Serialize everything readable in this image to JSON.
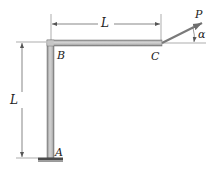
{
  "figure": {
    "type": "structural frame",
    "points": {
      "A": {
        "label": "A",
        "role": "fixed support"
      },
      "B": {
        "label": "B",
        "role": "corner joint"
      },
      "C": {
        "label": "C",
        "role": "free end"
      }
    },
    "dimensions": {
      "horizontal": {
        "label": "L",
        "span": "B to C"
      },
      "vertical": {
        "label": "L",
        "span": "A to B"
      }
    },
    "load": {
      "label": "P",
      "angle_label": "α",
      "applied_at": "C",
      "direction": "up and to the right, at angle α above horizontal"
    }
  },
  "colors": {
    "member_fill": "#b8b8b8",
    "member_edge": "#6e6e6e",
    "dimension_line": "#555555",
    "arrow": "#7a7a7a",
    "base": "#4a4a4a",
    "text": "#222222"
  }
}
